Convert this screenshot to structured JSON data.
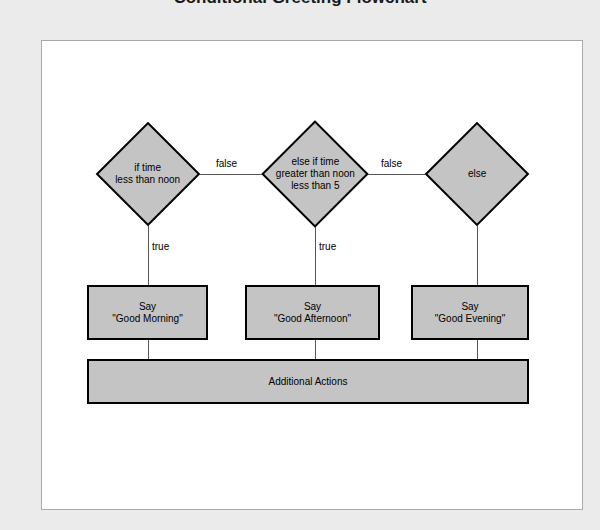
{
  "title": "Conditional Greeting Flowchart",
  "colors": {
    "page_background": "#ebebeb",
    "canvas_background": "#ffffff",
    "canvas_border": "#a9a9a9",
    "node_fill": "#c4c4c4",
    "node_border": "#000000",
    "edge": "#555555",
    "text": "#000000"
  },
  "diagram": {
    "type": "flowchart",
    "decisions": [
      {
        "id": "decision-1",
        "shape": "diamond",
        "lines": [
          "if time",
          "less than noon"
        ]
      },
      {
        "id": "decision-2",
        "shape": "diamond",
        "lines": [
          "else if time",
          "greater than noon",
          "less than 5"
        ]
      },
      {
        "id": "decision-3",
        "shape": "diamond",
        "lines": [
          "else"
        ]
      }
    ],
    "processes": [
      {
        "id": "process-1",
        "shape": "rectangle",
        "lines": [
          "Say",
          "\"Good Morning\""
        ]
      },
      {
        "id": "process-2",
        "shape": "rectangle",
        "lines": [
          "Say",
          "\"Good Afternoon\""
        ]
      },
      {
        "id": "process-3",
        "shape": "rectangle",
        "lines": [
          "Say",
          "\"Good Evening\""
        ]
      },
      {
        "id": "process-4",
        "shape": "rectangle",
        "lines": [
          "Additional Actions"
        ]
      }
    ],
    "edge_labels": {
      "false_1": "false",
      "false_2": "false",
      "true_1": "true",
      "true_2": "true"
    }
  }
}
